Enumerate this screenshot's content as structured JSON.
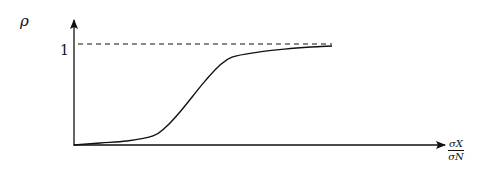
{
  "chart_data": {
    "type": "line",
    "title": "",
    "ylabel": "ρ",
    "xlabel": "σX / σN",
    "xlabel_parts": {
      "numerator": "σX",
      "denominator": "σN"
    },
    "yticks": [
      "1"
    ],
    "ylim": [
      0,
      1.1
    ],
    "xlim": [
      0,
      1
    ],
    "grid": false,
    "legend": null,
    "annotations": [
      "dashed asymptote at ρ = 1"
    ],
    "series": [
      {
        "name": "ρ vs σX/σN",
        "style": "solid",
        "x": [
          0.0,
          0.1,
          0.2,
          0.3,
          0.35,
          0.4,
          0.45,
          0.5,
          0.55,
          0.6,
          0.7,
          0.8,
          0.9,
          0.98
        ],
        "values": [
          0.0,
          0.02,
          0.04,
          0.09,
          0.18,
          0.32,
          0.48,
          0.64,
          0.78,
          0.87,
          0.92,
          0.95,
          0.97,
          0.98
        ]
      },
      {
        "name": "asymptote",
        "style": "dashed",
        "x": [
          0.0,
          0.98
        ],
        "values": [
          1.0,
          1.0
        ]
      }
    ]
  },
  "labels": {
    "y_axis": "ρ",
    "y_tick": "1",
    "x_num": "σX",
    "x_den": "σN"
  }
}
